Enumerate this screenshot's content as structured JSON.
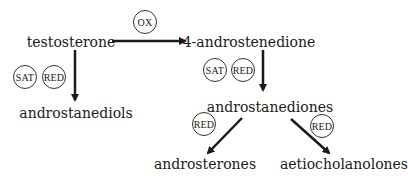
{
  "diagram": {
    "nodes": {
      "testosterone": "testosterone",
      "androstenedione": "4-androstenedione",
      "androstanediols": "androstanediols",
      "androstanediones": "androstanediones",
      "androsterones": "androsterones",
      "aetiocholanolones": "aetiocholanolones"
    },
    "edges": [
      {
        "from": "testosterone",
        "to": "4-androstenedione",
        "labels": [
          "OX"
        ]
      },
      {
        "from": "testosterone",
        "to": "androstanediols",
        "labels": [
          "SAT",
          "RED"
        ]
      },
      {
        "from": "4-androstenedione",
        "to": "androstanediones",
        "labels": [
          "SAT",
          "RED"
        ]
      },
      {
        "from": "androstanediones",
        "to": "androsterones",
        "labels": [
          "RED"
        ]
      },
      {
        "from": "androstanediones",
        "to": "aetiocholanolones",
        "labels": [
          "RED"
        ]
      }
    ],
    "badges": {
      "ox": "OX",
      "sat_left": "SAT",
      "red_left": "RED",
      "sat_right": "SAT",
      "red_right": "RED",
      "red_lower_left": "RED",
      "red_lower_right": "RED"
    },
    "colors": {
      "arrow": "#1a1a1a",
      "text": "#1a1a1a",
      "background": "#ffffff"
    }
  }
}
